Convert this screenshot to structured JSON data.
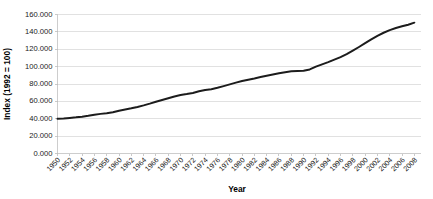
{
  "chart_data": {
    "type": "line",
    "title": "",
    "xlabel": "Year",
    "ylabel": "Index (1992 = 100)",
    "xlim": [
      1950,
      2009
    ],
    "ylim": [
      0,
      160
    ],
    "grid": true,
    "legend": "none",
    "y_ticks": [
      "0.000",
      "20.000",
      "40.000",
      "60.000",
      "80.000",
      "100.000",
      "120.000",
      "140.000",
      "160.000"
    ],
    "y_tick_values": [
      0,
      20,
      40,
      60,
      80,
      100,
      120,
      140,
      160
    ],
    "x_ticks": [
      "1950",
      "1952",
      "1954",
      "1956",
      "1958",
      "1960",
      "1962",
      "1964",
      "1966",
      "1968",
      "1970",
      "1972",
      "1974",
      "1976",
      "1978",
      "1980",
      "1982",
      "1984",
      "1986",
      "1988",
      "1990",
      "1992",
      "1994",
      "1996",
      "1998",
      "2000",
      "2002",
      "2004",
      "2006",
      "2008"
    ],
    "series": [
      {
        "name": "Index (1992 = 100)",
        "color": "#1c1c1c",
        "x": [
          1950,
          1951,
          1952,
          1953,
          1954,
          1955,
          1956,
          1957,
          1958,
          1959,
          1960,
          1961,
          1962,
          1963,
          1964,
          1965,
          1966,
          1967,
          1968,
          1969,
          1970,
          1971,
          1972,
          1973,
          1974,
          1975,
          1976,
          1977,
          1978,
          1979,
          1980,
          1981,
          1982,
          1983,
          1984,
          1985,
          1986,
          1987,
          1988,
          1989,
          1990,
          1991,
          1992,
          1993,
          1994,
          1995,
          1996,
          1997,
          1998,
          1999,
          2000,
          2001,
          2002,
          2003,
          2004,
          2005,
          2006,
          2007,
          2008
        ],
        "values": [
          40.0,
          40.4,
          41.0,
          41.6,
          42.4,
          43.4,
          44.6,
          45.6,
          46.4,
          47.6,
          49.2,
          50.6,
          52.0,
          53.6,
          55.4,
          57.4,
          59.6,
          61.6,
          63.6,
          65.6,
          67.4,
          68.4,
          69.6,
          71.6,
          73.2,
          74.0,
          75.6,
          77.6,
          79.6,
          81.6,
          83.4,
          85.0,
          86.4,
          88.0,
          89.6,
          91.0,
          92.4,
          93.6,
          94.6,
          95.0,
          95.2,
          96.8,
          100.0,
          102.6,
          105.2,
          108.0,
          111.0,
          114.4,
          118.4,
          122.6,
          127.0,
          131.4,
          135.4,
          139.0,
          142.0,
          144.4,
          146.4,
          148.2,
          150.6
        ]
      }
    ]
  }
}
